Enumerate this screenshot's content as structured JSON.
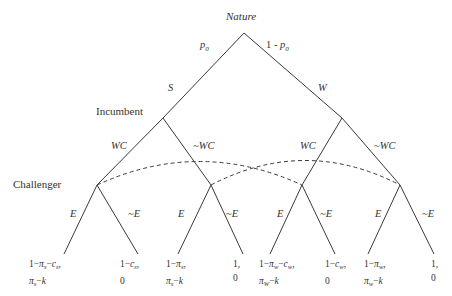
{
  "diagram": {
    "type": "extensive-form game tree",
    "players": {
      "root": "Nature",
      "level1": "Incumbent",
      "level2": "Challenger"
    },
    "nature_branches": [
      {
        "label": "S",
        "prob": "p0"
      },
      {
        "label": "W",
        "prob": "1 - p0"
      }
    ],
    "incumbent_actions": [
      "WC",
      "~WC"
    ],
    "challenger_actions": [
      "E",
      "~E"
    ],
    "information_sets": [
      {
        "nodes": [
          "S-WC",
          "W-WC"
        ],
        "style": "dashed"
      },
      {
        "nodes": [
          "S-~WC",
          "W-~WC"
        ],
        "style": "dashed"
      }
    ],
    "payoffs": [
      {
        "path": "S,WC,E",
        "incumbent": "1−πs−cs,",
        "challenger": "πs−k"
      },
      {
        "path": "S,WC,~E",
        "incumbent": "1−cs,",
        "challenger": "0"
      },
      {
        "path": "S,~WC,E",
        "incumbent": "1−πs,",
        "challenger": "πs−k"
      },
      {
        "path": "S,~WC,~E",
        "incumbent": "1,",
        "challenger": "0"
      },
      {
        "path": "W,WC,E",
        "incumbent": "1−πw−cw,",
        "challenger": "πw−k"
      },
      {
        "path": "W,WC,~E",
        "incumbent": "1−cw,",
        "challenger": "0"
      },
      {
        "path": "W,~WC,E",
        "incumbent": "1−πw,",
        "challenger": "πw−k"
      },
      {
        "path": "W,~WC,~E",
        "incumbent": "1,",
        "challenger": "0"
      }
    ]
  },
  "labels": {
    "nature": "Nature",
    "incumbent": "Incumbent",
    "challenger": "Challenger",
    "p0": "p",
    "p0_sub": "0",
    "one_minus": "1 - ",
    "S": "S",
    "W": "W",
    "WC": "WC",
    "notWC": "~WC",
    "E": "E",
    "notE": "~E"
  },
  "colors": {
    "line": "#3a3a3a",
    "text": "#333333",
    "background": "#ffffff"
  }
}
